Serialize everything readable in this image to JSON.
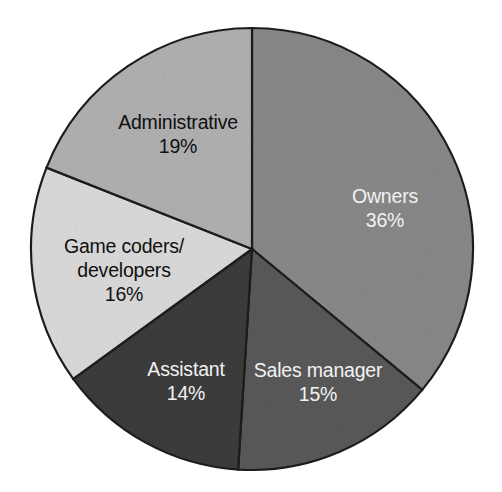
{
  "figure": {
    "background_color": "#ffffff",
    "outline_color": "#1d1d1d"
  },
  "chart_data": {
    "type": "pie",
    "title": "",
    "subtitle": "",
    "xlabel": "",
    "ylabel": "",
    "legend_position": "none",
    "grid": false,
    "units": "percent",
    "total": 100,
    "start_angle_deg": 0,
    "direction": "clockwise",
    "categories": [
      "Owners",
      "Sales manager",
      "Assistant",
      "Game coders/developers",
      "Administrative"
    ],
    "values": [
      36,
      15,
      14,
      16,
      19
    ],
    "value_labels": [
      "36%",
      "15%",
      "14%",
      "16%",
      "19%"
    ],
    "slices": [
      {
        "label": "Owners",
        "label_lines": [
          "Owners"
        ],
        "value": 36,
        "value_label": "36%",
        "color": "#8a8a8a",
        "text_color": "#f2f2f2",
        "text_tone": "light",
        "label_x": 385,
        "label_y": 198,
        "value_x": 385,
        "value_y": 222
      },
      {
        "label": "Sales manager",
        "label_lines": [
          "Sales manager"
        ],
        "value": 15,
        "value_label": "15%",
        "color": "#5a5a5a",
        "text_color": "#f2f2f2",
        "text_tone": "light",
        "label_x": 318,
        "label_y": 372,
        "value_x": 318,
        "value_y": 396
      },
      {
        "label": "Assistant",
        "label_lines": [
          "Assistant"
        ],
        "value": 14,
        "value_label": "14%",
        "color": "#3c3c3c",
        "text_color": "#f2f2f2",
        "text_tone": "light",
        "label_x": 186,
        "label_y": 371,
        "value_x": 186,
        "value_y": 395
      },
      {
        "label": "Game coders/developers",
        "label_lines": [
          "Game coders/",
          "developers"
        ],
        "value": 16,
        "value_label": "16%",
        "color": "#dcdcdc",
        "text_color": "#101010",
        "text_tone": "dark",
        "label_x": 124,
        "label_y": 248,
        "value_x": 124,
        "value_y": 296
      },
      {
        "label": "Administrative",
        "label_lines": [
          "Administrative"
        ],
        "value": 19,
        "value_label": "19%",
        "color": "#b2b2b2",
        "text_color": "#101010",
        "text_tone": "dark",
        "label_x": 178,
        "label_y": 124,
        "value_x": 178,
        "value_y": 148
      }
    ],
    "geometry": {
      "center_x": 252,
      "center_y": 249,
      "radius": 221
    }
  }
}
